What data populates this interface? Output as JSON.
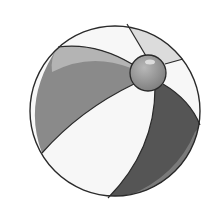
{
  "image": {
    "subject": "beach ball",
    "style": "grayscale illustration",
    "colors": {
      "background": "#ffffff",
      "outline": "#2a2a2a",
      "white_panel": "#f7f7f7",
      "light_gray_panel": "#dcdcdc",
      "mid_gray_panel": "#8a8a8a",
      "mid_gray_highlight": "#b4b4b4",
      "dark_gray_panel": "#555555",
      "dark_gray_highlight": "#7a7a7a",
      "valve": "#8c8c8c",
      "valve_highlight": "#cfcfcf"
    }
  }
}
